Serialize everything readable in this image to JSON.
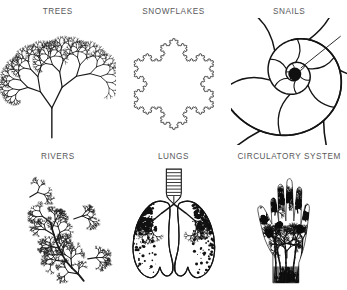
{
  "figure": {
    "background_color": "#ffffff",
    "ink_color": "#1a1a1a",
    "label_color": "#59595b",
    "columns": 3,
    "rows": 2,
    "panels": [
      {
        "id": "trees",
        "label": "TREES",
        "icon": "fractal-tree-icon",
        "row": 1,
        "col": 1
      },
      {
        "id": "snowflakes",
        "label": "SNOWFLAKES",
        "icon": "koch-snowflake-icon",
        "row": 1,
        "col": 2
      },
      {
        "id": "snails",
        "label": "SNAILS",
        "icon": "nautilus-spiral-icon",
        "row": 1,
        "col": 3
      },
      {
        "id": "rivers",
        "label": "RIVERS",
        "icon": "river-network-icon",
        "row": 2,
        "col": 1
      },
      {
        "id": "lungs",
        "label": "LUNGS",
        "icon": "lungs-icon",
        "row": 2,
        "col": 2
      },
      {
        "id": "circulatory-system",
        "label": "CIRCULATORY SYSTEM",
        "icon": "hand-vasculature-icon",
        "row": 2,
        "col": 3
      }
    ]
  }
}
